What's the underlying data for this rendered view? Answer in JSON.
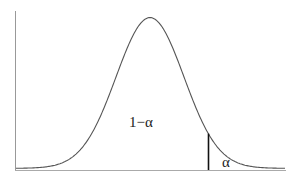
{
  "chart_data": {
    "type": "line",
    "title": "",
    "xlabel": "",
    "ylabel": "",
    "series": [
      {
        "name": "density",
        "distribution": "normal",
        "mean_px": 150,
        "sigma_px": 34
      }
    ],
    "critical_line": {
      "position": "right tail",
      "x_px": 208
    },
    "annotations": [
      {
        "text": "1−α",
        "region": "central area under curve"
      },
      {
        "text": "α",
        "region": "right tail beyond critical value"
      }
    ],
    "grid": false,
    "legend": null
  },
  "labels": {
    "center": "1−α",
    "tail": "α"
  },
  "colors": {
    "curve": "#555555",
    "axes": "#888888",
    "critical_line": "#111111",
    "text": "#222222"
  }
}
